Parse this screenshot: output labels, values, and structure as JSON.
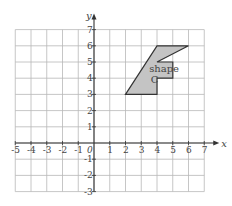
{
  "diagram": {
    "type": "coordinate-grid",
    "x_axis": {
      "label": "x",
      "min": -5,
      "max": 7,
      "ticks": [
        "-5",
        "-4",
        "-3",
        "-2",
        "-1",
        "1",
        "2",
        "3",
        "4",
        "5",
        "6",
        "7"
      ]
    },
    "y_axis": {
      "label": "y",
      "min": -3,
      "max": 7,
      "ticks": [
        "7",
        "6",
        "5",
        "4",
        "3",
        "2",
        "1",
        "-1",
        "-2",
        "-3"
      ]
    },
    "origin_label": "0",
    "grid": true,
    "colors": {
      "grid": "#b8b8b8",
      "axis": "#333333",
      "shape_fill": "#c4c4c4",
      "shape_stroke": "#333333",
      "text": "#444444"
    },
    "shape": {
      "name": "shape C",
      "label_line1": "shape",
      "label_line2": "C",
      "vertices": [
        [
          2,
          3
        ],
        [
          4,
          6
        ],
        [
          6,
          6
        ],
        [
          4,
          5
        ],
        [
          5,
          5
        ],
        [
          5,
          4
        ],
        [
          4,
          4
        ],
        [
          4,
          3
        ]
      ]
    }
  }
}
